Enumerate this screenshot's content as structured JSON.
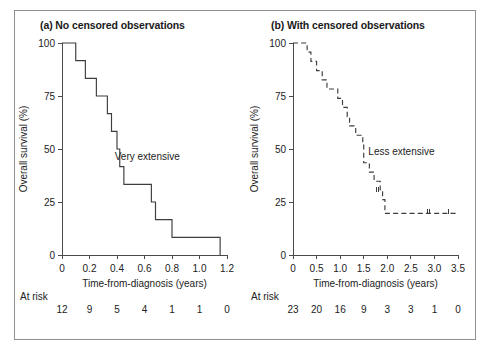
{
  "figure": {
    "border_color": "#8f8f8f",
    "background": "#ffffff",
    "curve_color": "#3d3d3d"
  },
  "chart_data": [
    {
      "type": "line",
      "panel_id": "a",
      "title": "(a) No censored observations",
      "xlabel": "Time-from-diagnosis (years)",
      "ylabel": "Overall survival (%)",
      "xlim": [
        0,
        1.2
      ],
      "ylim": [
        0,
        100
      ],
      "xticks": [
        0,
        0.2,
        0.4,
        0.6,
        0.8,
        1.0,
        1.2
      ],
      "xticklabels": [
        "0",
        "0.2",
        "0.4",
        "0.6",
        "0.8",
        "1.0",
        "1.2"
      ],
      "yticks": [
        0,
        25,
        50,
        75,
        100
      ],
      "yticklabels": [
        "0",
        "25",
        "50",
        "75",
        "100"
      ],
      "grid": false,
      "legend": "none",
      "annotation": "Very extensive",
      "annotation_x": 0.62,
      "annotation_y": 45,
      "line_style": "solid",
      "steps": [
        {
          "time": 0.0,
          "survival": 100.0
        },
        {
          "time": 0.1,
          "survival": 91.7
        },
        {
          "time": 0.17,
          "survival": 83.3
        },
        {
          "time": 0.25,
          "survival": 75.0
        },
        {
          "time": 0.33,
          "survival": 66.7
        },
        {
          "time": 0.36,
          "survival": 58.3
        },
        {
          "time": 0.4,
          "survival": 50.0
        },
        {
          "time": 0.42,
          "survival": 41.7
        },
        {
          "time": 0.45,
          "survival": 33.3
        },
        {
          "time": 0.65,
          "survival": 25.0
        },
        {
          "time": 0.68,
          "survival": 16.7
        },
        {
          "time": 0.8,
          "survival": 8.3
        },
        {
          "time": 1.15,
          "survival": 0.0
        }
      ],
      "censored": [],
      "at_risk": {
        "label": "At risk",
        "times": [
          0,
          0.2,
          0.4,
          0.6,
          0.8,
          1.0,
          1.2
        ],
        "counts": [
          "12",
          "9",
          "5",
          "4",
          "1",
          "1",
          "0"
        ]
      }
    },
    {
      "type": "line",
      "panel_id": "b",
      "title": "(b) With censored observations",
      "xlabel": "Time-from-diagnosis (years)",
      "ylabel": "Overall survival (%)",
      "xlim": [
        0,
        3.5
      ],
      "ylim": [
        0,
        100
      ],
      "xticks": [
        0,
        0.5,
        1.0,
        1.5,
        2.0,
        2.5,
        3.0,
        3.5
      ],
      "xticklabels": [
        "0",
        "0.5",
        "1.0",
        "1.5",
        "2.0",
        "2.5",
        "3.0",
        "3.5"
      ],
      "yticks": [
        0,
        25,
        50,
        75,
        100
      ],
      "yticklabels": [
        "0",
        "25",
        "50",
        "75",
        "100"
      ],
      "grid": false,
      "legend": "none",
      "annotation": "Less extensive",
      "annotation_x": 2.3,
      "annotation_y": 47,
      "line_style": "dashed",
      "steps": [
        {
          "time": 0.0,
          "survival": 100.0
        },
        {
          "time": 0.3,
          "survival": 95.7
        },
        {
          "time": 0.38,
          "survival": 91.3
        },
        {
          "time": 0.5,
          "survival": 87.0
        },
        {
          "time": 0.62,
          "survival": 82.6
        },
        {
          "time": 0.72,
          "survival": 78.3
        },
        {
          "time": 0.95,
          "survival": 73.9
        },
        {
          "time": 1.05,
          "survival": 69.6
        },
        {
          "time": 1.15,
          "survival": 65.2
        },
        {
          "time": 1.2,
          "survival": 60.9
        },
        {
          "time": 1.33,
          "survival": 56.5
        },
        {
          "time": 1.48,
          "survival": 52.2
        },
        {
          "time": 1.5,
          "survival": 43.5
        },
        {
          "time": 1.62,
          "survival": 39.1
        },
        {
          "time": 1.72,
          "survival": 34.8
        },
        {
          "time": 1.85,
          "survival": 30.4
        },
        {
          "time": 1.9,
          "survival": 26.1
        },
        {
          "time": 1.95,
          "survival": 19.6
        }
      ],
      "censored": [
        {
          "time": 1.78,
          "survival": 30.4
        },
        {
          "time": 1.82,
          "survival": 30.4
        },
        {
          "time": 2.85,
          "survival": 19.6
        },
        {
          "time": 2.9,
          "survival": 19.6
        },
        {
          "time": 3.3,
          "survival": 19.6
        }
      ],
      "at_risk": {
        "label": "At risk",
        "times": [
          0,
          0.5,
          1.0,
          1.5,
          2.0,
          2.5,
          3.0,
          3.5
        ],
        "counts": [
          "23",
          "20",
          "16",
          "9",
          "3",
          "3",
          "1",
          "0"
        ]
      }
    }
  ]
}
